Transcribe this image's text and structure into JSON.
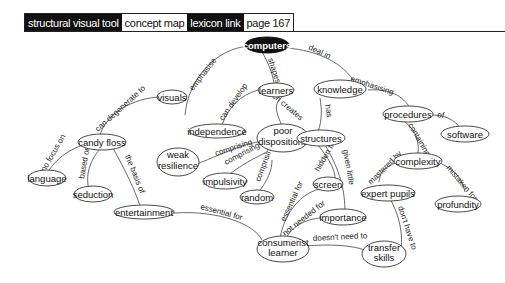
{
  "header": {
    "tabs": [
      {
        "label": "structural visual tool",
        "style": "dark"
      },
      {
        "label": "concept map",
        "style": "light"
      },
      {
        "label": "lexicon link",
        "style": "dark"
      },
      {
        "label": "page 167",
        "style": "light"
      }
    ]
  },
  "nodes": {
    "computers": "computers",
    "visuals": "visuals",
    "learners": "learners",
    "knowledge": "knowledge",
    "candy_floss": "candy floss",
    "independence": "independence",
    "poor_dispositions_1": "poor",
    "poor_dispositions_2": "dispositions",
    "structures": "structures",
    "procedures": "procedures",
    "software": "software",
    "complexity": "complexity",
    "language": "language",
    "seduction": "seduction",
    "weak_resilience_1": "weak",
    "weak_resilience_2": "resilience",
    "impulsivity": "impulsivity",
    "random": "random",
    "screen": "screen",
    "expert_pupils": "expert pupils",
    "profundity": "profundity",
    "entertainment": "entertainment",
    "importance": "importance",
    "consumerist_learner_1": "consumerist",
    "consumerist_learner_2": "learner",
    "transfer_skills_1": "transfer",
    "transfer_skills_2": "skills"
  },
  "links": {
    "emphasise": "emphasise",
    "shapes": "shapes",
    "deal_in": "deal in",
    "can_degenerate_to": "can degenerate to",
    "can_develop": "can develop",
    "often_creates": "often creates",
    "has": "has",
    "emphasising": "emphasising",
    "of": "of",
    "containing": "containing",
    "no_focus_on": "no focus on",
    "based_on": "based on",
    "the_basis_of": "the basis of",
    "comprising_1": "comprising",
    "comprising_2": "comprising",
    "comprising_3": "comprising",
    "hidden_from": "hidden from",
    "given_little": "given little",
    "mastered_by": "mastered by",
    "mistaken_for": "mistaken for",
    "essential_for_1": "essential for",
    "essential_for_2": "essential for",
    "not_needed_for": "not needed for",
    "doesnt_need_to": "doesn't need to",
    "dont_have_to": "don't have to"
  }
}
